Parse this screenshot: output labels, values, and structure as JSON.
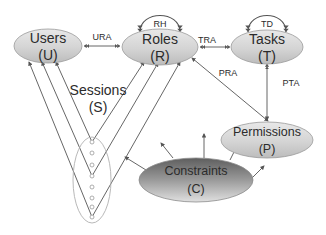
{
  "diagram": {
    "type": "RBAC model diagram",
    "nodes": [
      {
        "id": "users",
        "label": "Users",
        "abbr": "(U)"
      },
      {
        "id": "roles",
        "label": "Roles",
        "abbr": "(R)"
      },
      {
        "id": "tasks",
        "label": "Tasks",
        "abbr": "(T)"
      },
      {
        "id": "permissions",
        "label": "Permissions",
        "abbr": "(P)"
      },
      {
        "id": "constraints",
        "label": "Constraints",
        "abbr": "(C)"
      },
      {
        "id": "sessions",
        "label": "Sessions",
        "abbr": "(S)"
      }
    ],
    "edges": [
      {
        "from": "users",
        "to": "roles",
        "label": "URA"
      },
      {
        "from": "roles",
        "to": "roles",
        "label": "RH"
      },
      {
        "from": "roles",
        "to": "tasks",
        "label": "TRA"
      },
      {
        "from": "tasks",
        "to": "tasks",
        "label": "TD"
      },
      {
        "from": "roles",
        "to": "permissions",
        "label": "PRA"
      },
      {
        "from": "tasks",
        "to": "permissions",
        "label": "PTA"
      }
    ],
    "labels": {
      "users": "Users",
      "users_abbr": "(U)",
      "roles": "Roles",
      "roles_abbr": "(R)",
      "tasks": "Tasks",
      "tasks_abbr": "(T)",
      "permissions": "Permissions",
      "permissions_abbr": "(P)",
      "constraints": "Constraints",
      "constraints_abbr": "(C)",
      "sessions": "Sessions",
      "sessions_abbr": "(S)",
      "ura": "URA",
      "rh": "RH",
      "tra": "TRA",
      "td": "TD",
      "pra": "PRA",
      "pta": "PTA"
    },
    "colors": {
      "node_fill_top": "#e6e6e6",
      "node_fill_bottom": "#bfbfbf",
      "constraints_fill_top": "#6e6e6e",
      "constraints_fill_bottom": "#d9d9d9",
      "stroke": "#8c8c8c",
      "line": "#555555"
    }
  }
}
